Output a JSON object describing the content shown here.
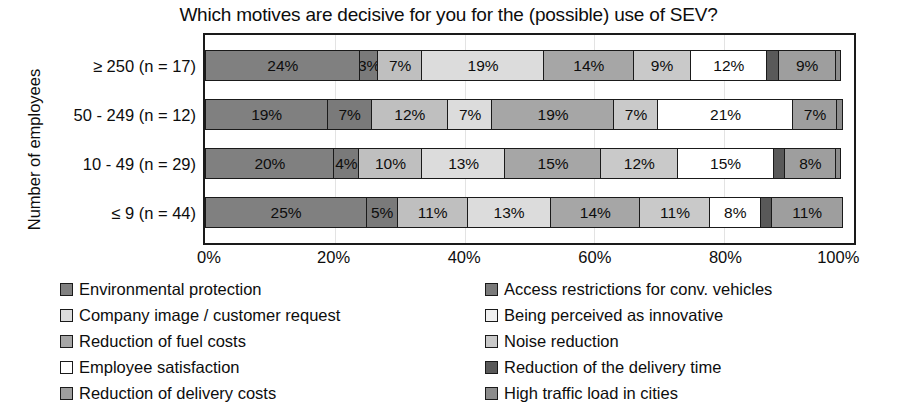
{
  "chart_data": {
    "type": "bar",
    "subtype": "horizontal-stacked-100",
    "title": "Which motives are decisive for you for the (possible) use of SEV?",
    "xlabel": "",
    "ylabel": "Number of employees",
    "xlim": [
      0,
      100
    ],
    "xticks": [
      "0%",
      "20%",
      "40%",
      "60%",
      "80%",
      "100%"
    ],
    "xtick_values": [
      0,
      20,
      40,
      60,
      80,
      100
    ],
    "grid": true,
    "legend_position": "bottom",
    "categories": [
      "≥ 250 (n = 17)",
      "50 - 249 (n = 12)",
      "10 - 49 (n = 29)",
      "≤ 9 (n = 44)"
    ],
    "series": [
      {
        "name": "Environmental protection",
        "color": "#808080",
        "values": [
          24,
          19,
          20,
          25
        ]
      },
      {
        "name": "Access restrictions for conv. vehicles",
        "color": "#7a7a7a",
        "values": [
          3,
          7,
          4,
          5
        ]
      },
      {
        "name": "Company image / customer request",
        "color": "#bfbfbf",
        "values": [
          7,
          12,
          10,
          11
        ]
      },
      {
        "name": "Being perceived as innovative",
        "color": "#dcdcdc",
        "values": [
          19,
          7,
          13,
          13
        ]
      },
      {
        "name": "Reduction of fuel costs",
        "color": "#a6a6a6",
        "values": [
          14,
          19,
          15,
          14
        ]
      },
      {
        "name": "Noise reduction",
        "color": "#c9c9c9",
        "values": [
          9,
          7,
          12,
          11
        ]
      },
      {
        "name": "Employee satisfaction",
        "color": "#ffffff",
        "values": [
          12,
          21,
          15,
          8
        ]
      },
      {
        "name": "Reduction of the delivery time",
        "color": "#595959",
        "values": [
          2,
          0,
          2,
          2
        ]
      },
      {
        "name": "Reduction of delivery costs",
        "color": "#9e9e9e",
        "values": [
          9,
          7,
          8,
          11
        ]
      },
      {
        "name": "High traffic load in cities",
        "color": "#8c8c8c",
        "values": [
          1,
          1,
          1,
          0
        ]
      }
    ],
    "bars": [
      {
        "category": "≥ 250 (n = 17)",
        "segments": [
          {
            "series": "Environmental protection",
            "value": 24,
            "label": "24%",
            "color": "#808080"
          },
          {
            "series": "Access restrictions for conv. vehicles",
            "value": 3,
            "label": "3%",
            "color": "#7a7a7a"
          },
          {
            "series": "Company image / customer request",
            "value": 7,
            "label": "7%",
            "color": "#bfbfbf"
          },
          {
            "series": "Being perceived as innovative",
            "value": 19,
            "label": "19%",
            "color": "#dcdcdc"
          },
          {
            "series": "Reduction of fuel costs",
            "value": 14,
            "label": "14%",
            "color": "#a6a6a6"
          },
          {
            "series": "Noise reduction",
            "value": 9,
            "label": "9%",
            "color": "#c9c9c9"
          },
          {
            "series": "Employee satisfaction",
            "value": 12,
            "label": "12%",
            "color": "#ffffff"
          },
          {
            "series": "Reduction of the delivery time",
            "value": 2,
            "label": "",
            "color": "#595959"
          },
          {
            "series": "Reduction of delivery costs",
            "value": 9,
            "label": "9%",
            "color": "#9e9e9e"
          },
          {
            "series": "High traffic load in cities",
            "value": 1,
            "label": "",
            "color": "#8c8c8c"
          }
        ]
      },
      {
        "category": "50 - 249 (n = 12)",
        "segments": [
          {
            "series": "Environmental protection",
            "value": 19,
            "label": "19%",
            "color": "#808080"
          },
          {
            "series": "Access restrictions for conv. vehicles",
            "value": 7,
            "label": "7%",
            "color": "#7a7a7a"
          },
          {
            "series": "Company image / customer request",
            "value": 12,
            "label": "12%",
            "color": "#bfbfbf"
          },
          {
            "series": "Being perceived as innovative",
            "value": 7,
            "label": "7%",
            "color": "#dcdcdc"
          },
          {
            "series": "Reduction of fuel costs",
            "value": 19,
            "label": "19%",
            "color": "#a6a6a6"
          },
          {
            "series": "Noise reduction",
            "value": 7,
            "label": "7%",
            "color": "#c9c9c9"
          },
          {
            "series": "Employee satisfaction",
            "value": 21,
            "label": "21%",
            "color": "#ffffff"
          },
          {
            "series": "Reduction of delivery costs",
            "value": 7,
            "label": "7%",
            "color": "#9e9e9e"
          },
          {
            "series": "High traffic load in cities",
            "value": 1,
            "label": "",
            "color": "#8c8c8c"
          }
        ]
      },
      {
        "category": "10 - 49 (n = 29)",
        "segments": [
          {
            "series": "Environmental protection",
            "value": 20,
            "label": "20%",
            "color": "#808080"
          },
          {
            "series": "Access restrictions for conv. vehicles",
            "value": 4,
            "label": "4%",
            "color": "#7a7a7a"
          },
          {
            "series": "Company image / customer request",
            "value": 10,
            "label": "10%",
            "color": "#bfbfbf"
          },
          {
            "series": "Being perceived as innovative",
            "value": 13,
            "label": "13%",
            "color": "#dcdcdc"
          },
          {
            "series": "Reduction of fuel costs",
            "value": 15,
            "label": "15%",
            "color": "#a6a6a6"
          },
          {
            "series": "Noise reduction",
            "value": 12,
            "label": "12%",
            "color": "#c9c9c9"
          },
          {
            "series": "Employee satisfaction",
            "value": 15,
            "label": "15%",
            "color": "#ffffff"
          },
          {
            "series": "Reduction of the delivery time",
            "value": 2,
            "label": "",
            "color": "#595959"
          },
          {
            "series": "Reduction of delivery costs",
            "value": 8,
            "label": "8%",
            "color": "#9e9e9e"
          },
          {
            "series": "High traffic load in cities",
            "value": 1,
            "label": "",
            "color": "#8c8c8c"
          }
        ]
      },
      {
        "category": "≤ 9 (n = 44)",
        "segments": [
          {
            "series": "Environmental protection",
            "value": 25,
            "label": "25%",
            "color": "#808080"
          },
          {
            "series": "Access restrictions for conv. vehicles",
            "value": 5,
            "label": "5%",
            "color": "#7a7a7a"
          },
          {
            "series": "Company image / customer request",
            "value": 11,
            "label": "11%",
            "color": "#bfbfbf"
          },
          {
            "series": "Being perceived as innovative",
            "value": 13,
            "label": "13%",
            "color": "#dcdcdc"
          },
          {
            "series": "Reduction of fuel costs",
            "value": 14,
            "label": "14%",
            "color": "#a6a6a6"
          },
          {
            "series": "Noise reduction",
            "value": 11,
            "label": "11%",
            "color": "#c9c9c9"
          },
          {
            "series": "Employee satisfaction",
            "value": 8,
            "label": "8%",
            "color": "#ffffff"
          },
          {
            "series": "Reduction of the delivery time",
            "value": 2,
            "label": "",
            "color": "#595959"
          },
          {
            "series": "Reduction of delivery costs",
            "value": 11,
            "label": "11%",
            "color": "#9e9e9e"
          }
        ]
      }
    ],
    "legend": {
      "columns": [
        [
          {
            "label": "Environmental protection",
            "color": "#808080"
          },
          {
            "label": "Company image / customer request",
            "color": "#dcdcdc"
          },
          {
            "label": "Reduction of fuel costs",
            "color": "#a6a6a6"
          },
          {
            "label": "Employee satisfaction",
            "color": "#ffffff"
          },
          {
            "label": "Reduction of delivery costs",
            "color": "#9e9e9e"
          }
        ],
        [
          {
            "label": "Access restrictions for conv. vehicles",
            "color": "#7a7a7a"
          },
          {
            "label": "Being perceived as innovative",
            "color": "#f0f0f0"
          },
          {
            "label": "Noise reduction",
            "color": "#c9c9c9"
          },
          {
            "label": "Reduction of the delivery time",
            "color": "#595959"
          },
          {
            "label": "High traffic load in cities",
            "color": "#8c8c8c"
          }
        ]
      ]
    }
  }
}
